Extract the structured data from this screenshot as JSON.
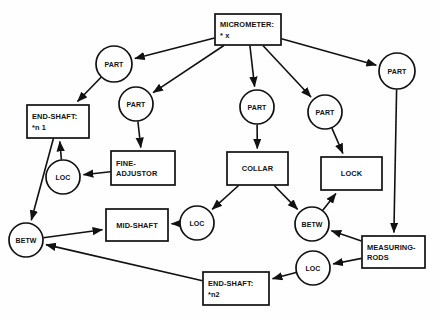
{
  "diagram": {
    "type": "semantic-network",
    "background_color": "#fefefe",
    "line_color": "#111111",
    "nodes": [
      {
        "id": "micrometer",
        "shape": "box",
        "lines": [
          "MICROMETER:",
          "* x"
        ],
        "x": 215,
        "y": 14,
        "w": 66,
        "h": 31
      },
      {
        "id": "part-1",
        "shape": "circle",
        "lines": [
          "PART"
        ],
        "cx": 114,
        "cy": 64,
        "r": 18
      },
      {
        "id": "part-2",
        "shape": "circle",
        "lines": [
          "PART"
        ],
        "cx": 136,
        "cy": 104,
        "r": 17
      },
      {
        "id": "part-3",
        "shape": "circle",
        "lines": [
          "PART"
        ],
        "cx": 257,
        "cy": 107,
        "r": 17
      },
      {
        "id": "part-4",
        "shape": "circle",
        "lines": [
          "PART"
        ],
        "cx": 325,
        "cy": 112,
        "r": 17
      },
      {
        "id": "part-5",
        "shape": "circle",
        "lines": [
          "PART"
        ],
        "cx": 397,
        "cy": 71,
        "r": 18
      },
      {
        "id": "end-shaft-n1",
        "shape": "box",
        "lines": [
          "END-SHAFT:",
          "*n 1"
        ],
        "x": 27,
        "y": 105,
        "w": 62,
        "h": 33
      },
      {
        "id": "fine-adjustor",
        "shape": "box",
        "lines": [
          "FINE-",
          "ADJUSTOR"
        ],
        "x": 111,
        "y": 151,
        "w": 64,
        "h": 34
      },
      {
        "id": "collar",
        "shape": "box",
        "lines": [
          "COLLAR"
        ],
        "x": 227,
        "y": 152,
        "w": 61,
        "h": 33
      },
      {
        "id": "lock",
        "shape": "box",
        "lines": [
          "LOCK"
        ],
        "x": 321,
        "y": 157,
        "w": 61,
        "h": 33
      },
      {
        "id": "loc-1",
        "shape": "circle",
        "lines": [
          "LOC"
        ],
        "cx": 63,
        "cy": 177,
        "r": 17
      },
      {
        "id": "mid-shaft",
        "shape": "box",
        "lines": [
          "MID-SHAFT"
        ],
        "x": 106,
        "y": 209,
        "w": 62,
        "h": 32
      },
      {
        "id": "loc-2",
        "shape": "circle",
        "lines": [
          "LOC"
        ],
        "cx": 197,
        "cy": 223,
        "r": 17
      },
      {
        "id": "betw-left",
        "shape": "circle",
        "lines": [
          "BETW"
        ],
        "cx": 26,
        "cy": 240,
        "r": 17
      },
      {
        "id": "betw-right",
        "shape": "circle",
        "lines": [
          "BETW"
        ],
        "cx": 312,
        "cy": 224,
        "r": 17
      },
      {
        "id": "measuring-rods",
        "shape": "box",
        "lines": [
          "MEASURING-",
          "RODS"
        ],
        "x": 362,
        "y": 236,
        "w": 63,
        "h": 32
      },
      {
        "id": "loc-3",
        "shape": "circle",
        "lines": [
          "LOC"
        ],
        "cx": 313,
        "cy": 268,
        "r": 17
      },
      {
        "id": "end-shaft-n2",
        "shape": "box",
        "lines": [
          "END-SHAFT:",
          "*n2"
        ],
        "x": 203,
        "y": 272,
        "w": 66,
        "h": 33
      }
    ],
    "edges": [
      {
        "from": "micrometer",
        "to": "part-1",
        "arrow": true
      },
      {
        "from": "micrometer",
        "to": "part-2",
        "arrow": true
      },
      {
        "from": "micrometer",
        "to": "part-3",
        "arrow": true
      },
      {
        "from": "micrometer",
        "to": "part-4",
        "arrow": true
      },
      {
        "from": "micrometer",
        "to": "part-5",
        "arrow": true
      },
      {
        "from": "part-1",
        "to": "end-shaft-n1",
        "arrow": true
      },
      {
        "from": "part-2",
        "to": "fine-adjustor",
        "arrow": true
      },
      {
        "from": "part-3",
        "to": "collar",
        "arrow": true
      },
      {
        "from": "part-4",
        "to": "lock",
        "arrow": true
      },
      {
        "from": "part-5",
        "to": "measuring-rods",
        "arrow": true
      },
      {
        "from": "fine-adjustor",
        "to": "loc-1",
        "arrow": true
      },
      {
        "from": "loc-1",
        "to": "end-shaft-n1",
        "arrow": true
      },
      {
        "from": "end-shaft-n1",
        "to": "betw-left",
        "arrow": true
      },
      {
        "from": "betw-left",
        "to": "mid-shaft",
        "arrow": true
      },
      {
        "from": "collar",
        "to": "loc-2",
        "arrow": true
      },
      {
        "from": "loc-2",
        "to": "mid-shaft",
        "arrow": true
      },
      {
        "from": "collar",
        "to": "betw-right",
        "arrow": true
      },
      {
        "from": "betw-right",
        "to": "lock",
        "arrow": true
      },
      {
        "from": "measuring-rods",
        "to": "betw-right",
        "arrow": true
      },
      {
        "from": "measuring-rods",
        "to": "loc-3",
        "arrow": true
      },
      {
        "from": "loc-3",
        "to": "end-shaft-n2",
        "arrow": true
      },
      {
        "from": "end-shaft-n2",
        "to": "betw-left",
        "arrow": true
      }
    ]
  }
}
